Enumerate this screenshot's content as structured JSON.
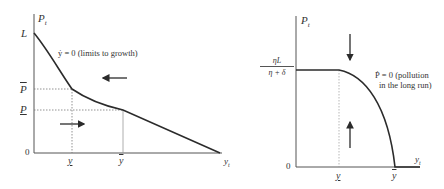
{
  "left_panel": {
    "y_axis_label": "P",
    "y_axis_sub": "t",
    "x_axis_label": "y",
    "x_axis_sub": "t",
    "origin_label": "0",
    "y_ticks": {
      "L": "L",
      "P_bar": "P",
      "P_under": "P"
    },
    "x_ticks": {
      "y_under": "y",
      "y_bar": "y"
    },
    "curve_label": "ẏ = 0 (limits to growth)",
    "arrows": [
      "left",
      "right"
    ]
  },
  "right_panel": {
    "y_axis_label": "P",
    "y_axis_sub": "t",
    "x_axis_label": "y",
    "x_axis_sub": "t",
    "origin_label": "0",
    "y_tick_fraction": {
      "numerator": "ηL",
      "denominator": "η + δ"
    },
    "x_ticks": {
      "y_under": "y",
      "y_bar": "y"
    },
    "curve_label_line1": "Ṗ = 0 (pollution",
    "curve_label_line2": "in the long run)",
    "arrows": [
      "down",
      "up"
    ]
  },
  "colors": {
    "line": "#2b2b2b",
    "axis": "#555555",
    "dotted": "#777777",
    "text": "#333333"
  }
}
